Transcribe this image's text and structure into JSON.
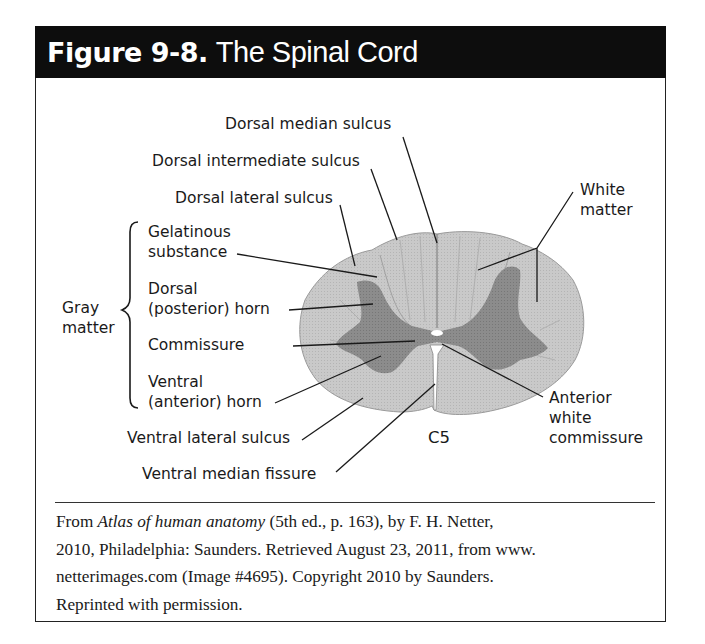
{
  "figure": {
    "number": "Figure 9-8.",
    "title": "The Spinal Cord",
    "colors": {
      "header_bg": "#0d0d0d",
      "white_matter": "#c9c9c9",
      "gray_matter": "#8c8c8c",
      "line": "#1a1a1a"
    }
  },
  "labels": {
    "dorsal_median_sulcus": "Dorsal median sulcus",
    "dorsal_intermediate_sulcus": "Dorsal intermediate sulcus",
    "dorsal_lateral_sulcus": "Dorsal lateral sulcus",
    "white_matter": [
      "White",
      "matter"
    ],
    "gray_matter": [
      "Gray",
      "matter"
    ],
    "gelatinous_substance": [
      "Gelatinous",
      "substance"
    ],
    "dorsal_horn": [
      "Dorsal",
      "(posterior) horn"
    ],
    "commissure": "Commissure",
    "ventral_horn": [
      "Ventral",
      "(anterior) horn"
    ],
    "ventral_lateral_sulcus": "Ventral lateral sulcus",
    "ventral_median_fissure": "Ventral median fissure",
    "anterior_white_commissure": [
      "Anterior",
      "white",
      "commissure"
    ],
    "segment": "C5"
  },
  "caption": {
    "prefix": "From ",
    "book_title": "Atlas of human anatomy",
    "line1_rest": " (5th ed., p. 163), by F. H. Netter,",
    "line2": "2010, Philadelphia: Saunders. Retrieved August 23, 2011, from www.",
    "line3": "netterimages.com (Image #4695). Copyright 2010 by Saunders.",
    "line4": "Reprinted with permission."
  }
}
